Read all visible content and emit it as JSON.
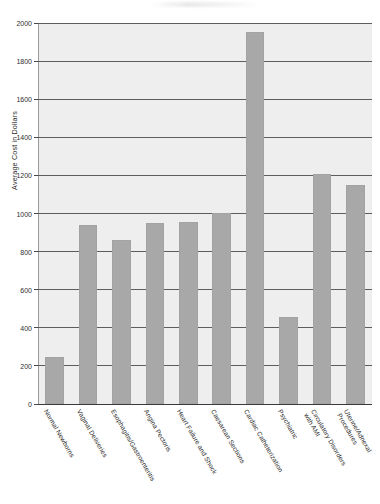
{
  "figure": {
    "y_axis_title": "Average Cost in Dollars",
    "bar_color": "#a8a8a8",
    "plot_background": "#eeeeee",
    "gridline_color": "#5d5d5d"
  },
  "chart_data": {
    "type": "bar",
    "title": "",
    "xlabel": "",
    "ylabel": "Average Cost in Dollars",
    "ylim": [
      0,
      2000
    ],
    "ytick_step": 200,
    "grid": true,
    "legend": "none",
    "orientation": "vertical",
    "xtick_rotation": -60,
    "categories": [
      "Normal Newborns",
      "Vaginal Deliveries",
      "Esophagitis/Gastroenteritis",
      "Angina Pectoris",
      "Heart Failure and Shock",
      "Caesarean Sections",
      "Cardiac Catheterization",
      "Psychiatric",
      "Circulatory Disorders with AMI",
      "Uterine/Adnexal Procedures"
    ],
    "category_lines": [
      [
        "Normal Newborns"
      ],
      [
        "Vaginal Deliveries"
      ],
      [
        "Esophagitis/Gastroenteritis"
      ],
      [
        "Angina Pectoris"
      ],
      [
        "Heart Failure and Shock"
      ],
      [
        "Caesarean Sections"
      ],
      [
        "Cardiac Catheterization"
      ],
      [
        "Psychiatric"
      ],
      [
        "Circulatory Disorders",
        "with AMI"
      ],
      [
        "Uterine/Adnexal",
        "Procedures"
      ]
    ],
    "values": [
      245,
      940,
      860,
      950,
      955,
      1005,
      1955,
      455,
      1210,
      1150
    ],
    "yticks": [
      0,
      200,
      400,
      600,
      800,
      1000,
      1200,
      1400,
      1600,
      1800,
      2000
    ],
    "ytick_labels": [
      "0",
      "200",
      "400",
      "600",
      "800",
      "1000",
      "1200",
      "1400",
      "1600",
      "1800",
      "2000"
    ]
  }
}
